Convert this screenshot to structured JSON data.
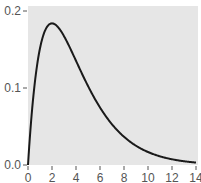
{
  "chart_data": {
    "type": "line",
    "title": "",
    "xlabel": "",
    "ylabel": "",
    "xlim": [
      0,
      14
    ],
    "ylim": [
      0,
      0.2
    ],
    "xticks": [
      0,
      2,
      4,
      6,
      8,
      10,
      12,
      14
    ],
    "xtick_labels": [
      "0",
      "2",
      "4",
      "6",
      "8",
      "10",
      "12",
      "14"
    ],
    "yticks": [
      0.0,
      0.1,
      0.2
    ],
    "ytick_labels": [
      "0.0",
      "0.1",
      "0.2"
    ],
    "grid": false,
    "legend": null,
    "background": "#e6e6e6",
    "line_color": "#1a1a1a",
    "series": [
      {
        "name": "density",
        "description": "chi-square distribution density, 4 degrees of freedom",
        "x": [
          0,
          0.5,
          1,
          1.5,
          2,
          2.5,
          3,
          3.5,
          4,
          5,
          6,
          7,
          8,
          9,
          10,
          11,
          12,
          13,
          14
        ],
        "y": [
          0,
          0.097,
          0.152,
          0.177,
          0.184,
          0.179,
          0.167,
          0.152,
          0.135,
          0.103,
          0.075,
          0.053,
          0.037,
          0.025,
          0.017,
          0.011,
          0.007,
          0.005,
          0.003
        ]
      }
    ]
  }
}
